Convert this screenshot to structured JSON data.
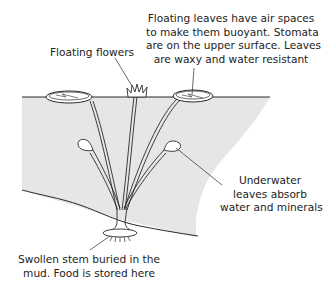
{
  "diagram": {
    "colors": {
      "water": "#e6e6e6",
      "line": "#2a2a2a",
      "text": "#222222",
      "background": "#ffffff"
    },
    "labels": {
      "floating_flowers": {
        "lines": [
          "Floating flowers"
        ]
      },
      "floating_leaves": {
        "lines": [
          "Floating leaves have air spaces",
          "to make them buoyant. Stomata",
          "are on the upper surface. Leaves",
          "are waxy and water resistant"
        ]
      },
      "underwater_leaves": {
        "lines": [
          "Underwater",
          "leaves absorb",
          "water and minerals"
        ]
      },
      "swollen_stem": {
        "lines": [
          "Swollen stem buried in the",
          "mud. Food is stored here"
        ]
      }
    }
  }
}
